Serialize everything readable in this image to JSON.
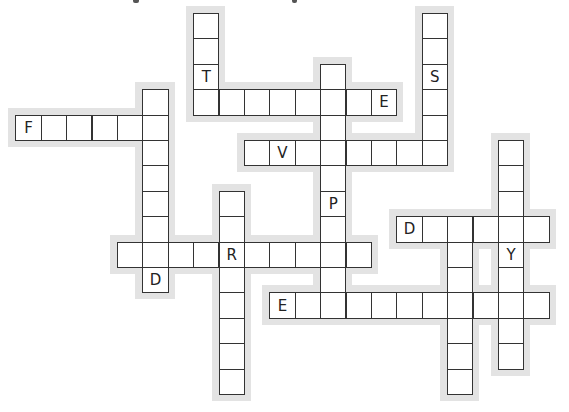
{
  "puzzle": {
    "cell_size": 25.4,
    "origin_x": 15.3,
    "origin_y": 13,
    "halo_pad": 7,
    "colors": {
      "halo": "#e3e3e3",
      "cell_bg": "#ffffff",
      "cell_border": "#333333",
      "letter": "#222222"
    },
    "words": [
      {
        "id": "w1",
        "dir": "down",
        "row": 0,
        "col": 7,
        "len": 4,
        "given": {
          "2": "T"
        }
      },
      {
        "id": "w2",
        "dir": "across",
        "row": 3,
        "col": 7,
        "len": 8,
        "given": {
          "7": "E"
        }
      },
      {
        "id": "w3",
        "dir": "down",
        "row": 0,
        "col": 16,
        "len": 6,
        "given": {
          "2": "S"
        }
      },
      {
        "id": "w4",
        "dir": "across",
        "row": 4,
        "col": 0,
        "len": 6,
        "given": {
          "0": "F"
        }
      },
      {
        "id": "w5",
        "dir": "down",
        "row": 3,
        "col": 5,
        "len": 8,
        "given": {
          "7": "D"
        }
      },
      {
        "id": "w6",
        "dir": "down",
        "row": 2,
        "col": 12,
        "len": 10,
        "given": {
          "5": "P"
        }
      },
      {
        "id": "w7",
        "dir": "across",
        "row": 5,
        "col": 9,
        "len": 8,
        "given": {
          "1": "V"
        }
      },
      {
        "id": "w8",
        "dir": "down",
        "row": 7,
        "col": 8,
        "len": 8,
        "given": {}
      },
      {
        "id": "w9",
        "dir": "across",
        "row": 9,
        "col": 4,
        "len": 10,
        "given": {
          "4": "R"
        }
      },
      {
        "id": "w10",
        "dir": "across",
        "row": 8,
        "col": 15,
        "len": 6,
        "given": {
          "0": "D"
        }
      },
      {
        "id": "w11",
        "dir": "down",
        "row": 8,
        "col": 17,
        "len": 7,
        "given": {}
      },
      {
        "id": "w12",
        "dir": "down",
        "row": 5,
        "col": 19,
        "len": 9,
        "given": {
          "4": "Y"
        }
      },
      {
        "id": "w13",
        "dir": "across",
        "row": 11,
        "col": 10,
        "len": 11,
        "given": {
          "0": "E"
        }
      }
    ]
  }
}
